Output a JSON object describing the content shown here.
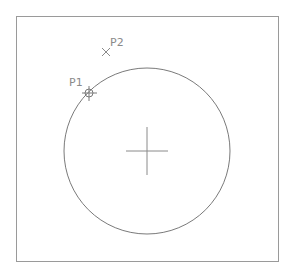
{
  "drawing": {
    "frame": {
      "x": 16,
      "y": 16,
      "width": 263,
      "height": 246,
      "color": "#9a9a9a"
    },
    "circle": {
      "cx": 147,
      "cy": 151,
      "r": 83,
      "color": "#7a7a7a"
    },
    "center_mark": {
      "cx": 147,
      "cy": 151,
      "half_w": 21,
      "half_h": 24,
      "color": "#8a8a8a"
    },
    "points": [
      {
        "id": "P1",
        "label": "P1",
        "x": 89,
        "y": 93,
        "marker": "circle-cross"
      },
      {
        "id": "P2",
        "label": "P2",
        "x": 106,
        "y": 52,
        "marker": "x"
      }
    ]
  }
}
